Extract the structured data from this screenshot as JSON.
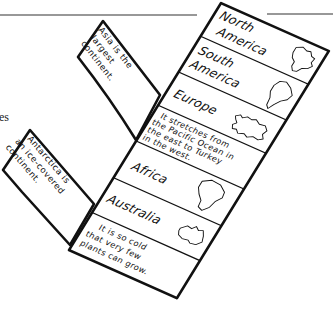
{
  "page": {
    "margin_fragment": "es",
    "colors": {
      "ink": "#111111",
      "paper": "#ffffff",
      "rule": "#333333"
    }
  },
  "foldable": {
    "sections": [
      {
        "label_lines": [
          "North",
          "America"
        ],
        "icon": "north-america-outline-icon"
      },
      {
        "label_lines": [
          "South",
          "America"
        ],
        "icon": "south-america-outline-icon"
      },
      {
        "label_lines": [
          "Europe"
        ],
        "icon": "europe-outline-icon"
      },
      {
        "note_lines": [
          "It stretches from",
          "the Pacific Ocean in",
          "the east to Turkey",
          "in the west."
        ]
      },
      {
        "label_lines": [
          "Africa"
        ],
        "icon": "africa-outline-icon"
      },
      {
        "label_lines": [
          "Australia"
        ],
        "icon": "australia-outline-icon"
      },
      {
        "note_lines": [
          "It is so cold",
          "that very few",
          "plants can grow."
        ]
      }
    ],
    "flaps": {
      "asia": {
        "lines": [
          "Asia is the",
          "largest",
          "continent."
        ]
      },
      "antarctica": {
        "lines": [
          "Antarctica is",
          "an ice-covered",
          "continent."
        ]
      }
    }
  }
}
